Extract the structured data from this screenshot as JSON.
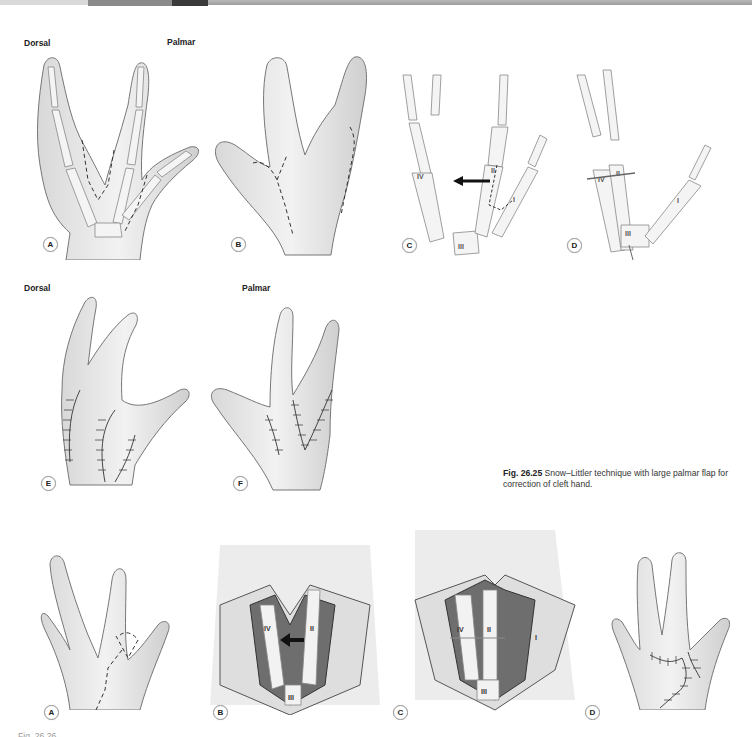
{
  "header_bar": {
    "segments": [
      "#d9d9d9",
      "#8a8a8a",
      "#3a3a3a",
      "#a8a8a8"
    ]
  },
  "figure_26_25": {
    "row1": {
      "view_titles": {
        "dorsal": "Dorsal",
        "palmar": "Palmar"
      },
      "panels": [
        {
          "label": "A",
          "description": "Dorsal skeletal view of cleft hand with dashed incision lines"
        },
        {
          "label": "B",
          "description": "Palmar view of cleft hand with dashed incision lines"
        },
        {
          "label": "C",
          "description": "Skeletal view with arrow showing transfer of metacarpal II toward IV",
          "bone_labels": [
            "IV",
            "III",
            "II",
            "I"
          ]
        },
        {
          "label": "D",
          "description": "Skeletal view after transposition with fixation",
          "bone_labels": [
            "IV",
            "III",
            "II",
            "I"
          ]
        }
      ]
    },
    "row2": {
      "view_titles": {
        "dorsal": "Dorsal",
        "palmar": "Palmar"
      },
      "panels": [
        {
          "label": "E",
          "description": "Dorsal view with sutured closure"
        },
        {
          "label": "F",
          "description": "Palmar view with sutured closure"
        }
      ]
    },
    "caption": {
      "fig_number": "Fig. 26.25",
      "text": "Snow–Littler technique with large palmar flap for correction of cleft hand."
    }
  },
  "figure_26_26": {
    "panels": [
      {
        "label": "A",
        "description": "Dorsal view of cleft hand with incision design"
      },
      {
        "label": "B",
        "description": "Opened flap exposing bones with arrow",
        "bone_labels": [
          "IV",
          "III",
          "II"
        ]
      },
      {
        "label": "C",
        "description": "Bones transposed and fixed",
        "bone_labels": [
          "IV",
          "III",
          "II",
          "I"
        ]
      },
      {
        "label": "D",
        "description": "Dorsal view with sutured closure"
      }
    ],
    "caption_partial": "Fig. 26.26 ..."
  }
}
